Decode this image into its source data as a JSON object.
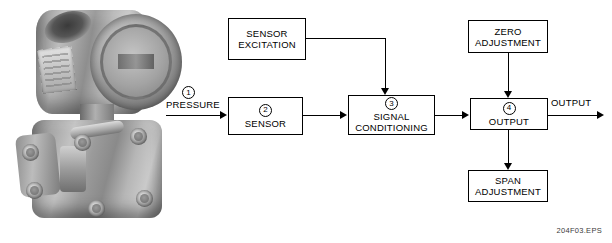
{
  "figure": {
    "reference": "204F03.EPS"
  },
  "photo": {
    "caption": "differential-pressure-transmitter-photo"
  },
  "diagram": {
    "input_label": "PRESSURE",
    "output_label": "OUTPUT",
    "callouts": {
      "one": "1",
      "two": "2",
      "three": "3",
      "four": "4"
    },
    "boxes": {
      "sensor_excitation": {
        "line1": "SENSOR",
        "line2": "EXCITATION"
      },
      "sensor": {
        "callout": "2",
        "line1": "SENSOR"
      },
      "signal_conditioning": {
        "callout": "3",
        "line1": "SIGNAL",
        "line2": "CONDITIONING"
      },
      "zero_adjustment": {
        "line1": "ZERO",
        "line2": "ADJUSTMENT"
      },
      "output": {
        "callout": "4",
        "line1": "OUTPUT"
      },
      "span_adjustment": {
        "line1": "SPAN",
        "line2": "ADJUSTMENT"
      }
    }
  }
}
